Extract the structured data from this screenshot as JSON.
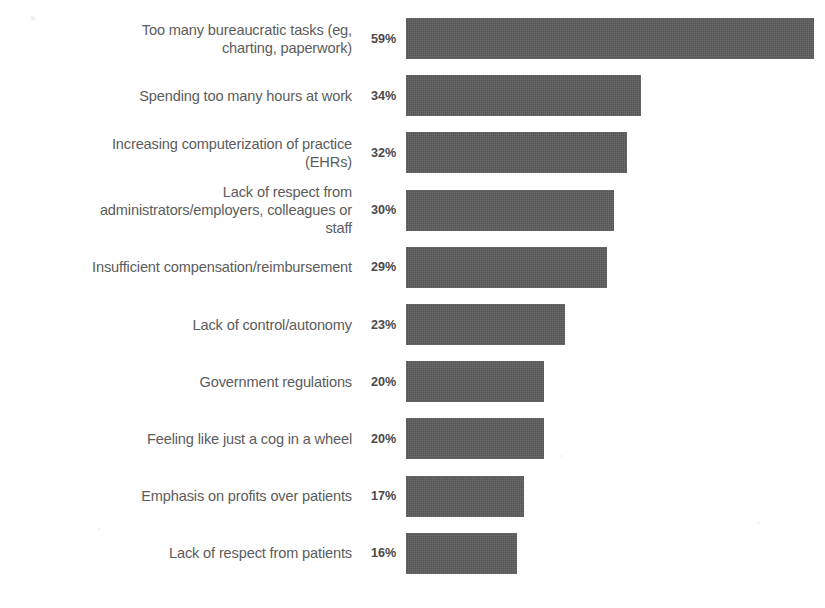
{
  "chart_data": {
    "type": "bar",
    "orientation": "horizontal",
    "title": "",
    "subtitle": "",
    "xlabel": "",
    "ylabel": "",
    "grid": false,
    "legend": null,
    "xlim": [
      0,
      59
    ],
    "value_suffix": "%",
    "bar_color": "#5a5a5a",
    "label_color": "#5c5c5c",
    "value_color": "#4a4a4a",
    "background_color": "#ffffff",
    "categories": [
      "Too many bureaucratic tasks (eg,\ncharting, paperwork)",
      "Spending too many hours at work",
      "Increasing computerization of practice\n(EHRs)",
      "Lack of respect from\nadministrators/employers, colleagues or\nstaff",
      "Insufficient compensation/reimbursement",
      "Lack of control/autonomy",
      "Government regulations",
      "Feeling like just a cog in a wheel",
      "Emphasis on profits over patients",
      "Lack of respect from patients"
    ],
    "values": [
      59,
      34,
      32,
      30,
      29,
      23,
      20,
      20,
      17,
      16
    ],
    "value_labels": [
      "59%",
      "34%",
      "32%",
      "30%",
      "29%",
      "23%",
      "20%",
      "20%",
      "17%",
      "16%"
    ],
    "bars": [
      {
        "label": "Too many bureaucratic tasks (eg,\ncharting, paperwork)",
        "value": 59,
        "value_label": "59%"
      },
      {
        "label": "Spending too many hours at work",
        "value": 34,
        "value_label": "34%"
      },
      {
        "label": "Increasing computerization of practice\n(EHRs)",
        "value": 32,
        "value_label": "32%"
      },
      {
        "label": "Lack of respect from\nadministrators/employers, colleagues or\nstaff",
        "value": 30,
        "value_label": "30%"
      },
      {
        "label": "Insufficient compensation/reimbursement",
        "value": 29,
        "value_label": "29%"
      },
      {
        "label": "Lack of control/autonomy",
        "value": 23,
        "value_label": "23%"
      },
      {
        "label": "Government regulations",
        "value": 20,
        "value_label": "20%"
      },
      {
        "label": "Feeling like just a cog in a wheel",
        "value": 20,
        "value_label": "20%"
      },
      {
        "label": "Emphasis on profits over patients",
        "value": 17,
        "value_label": "17%"
      },
      {
        "label": "Lack of respect from patients",
        "value": 16,
        "value_label": "16%"
      }
    ]
  },
  "layout": {
    "bar_origin_x": 406,
    "px_per_unit": 6.92,
    "bar_height": 41,
    "row_pitch": 57.2,
    "first_row_top": 18
  }
}
